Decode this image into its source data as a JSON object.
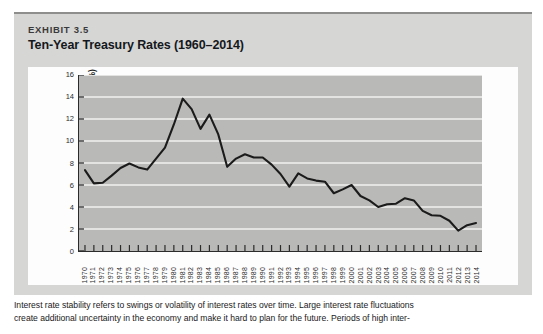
{
  "exhibit": {
    "label": "EXHIBIT 3.5",
    "title": "Ten-Year Treasury Rates (1960–2014)"
  },
  "caption": {
    "line1": "Interest rate stability refers to swings or volatility of interest rates over time. Large interest rate fluctuations",
    "line2": "create additional uncertainty in the economy and make it hard to plan for the future. Periods of high inter-"
  },
  "colors": {
    "exhibit_background": "#d6d6d4",
    "plot_background": "#b9b9b7",
    "gridline": "#f2f2f0",
    "line": "#1b1b1b",
    "axis": "#2b2b2b",
    "card_background": "#fdfdfd",
    "text": "#1a1a1a"
  },
  "chart_data": {
    "type": "line",
    "title": "Ten-Year Treasury Rates (1960–2014)",
    "xlabel": "",
    "ylabel": "10-Year treasury yield (%)",
    "ylim": [
      0,
      16
    ],
    "yticks": [
      0,
      2,
      4,
      6,
      8,
      10,
      12,
      14,
      16
    ],
    "ytick_labels": [
      "0",
      "2",
      "4",
      "6",
      "8",
      "10",
      "12",
      "14",
      "16"
    ],
    "grid": true,
    "grid_axis": "y",
    "legend": false,
    "legend_position": "none",
    "x": [
      1970,
      1971,
      1972,
      1973,
      1974,
      1975,
      1976,
      1977,
      1978,
      1979,
      1980,
      1981,
      1982,
      1983,
      1984,
      1985,
      1986,
      1987,
      1988,
      1989,
      1990,
      1991,
      1992,
      1993,
      1994,
      1995,
      1996,
      1997,
      1998,
      1999,
      2000,
      2001,
      2002,
      2003,
      2004,
      2005,
      2006,
      2007,
      2008,
      2009,
      2010,
      2011,
      2012,
      2013,
      2014
    ],
    "xtick_labels": [
      "1970",
      "1971",
      "1972",
      "1973",
      "1974",
      "1975",
      "1976",
      "1977",
      "1978",
      "1979",
      "1980",
      "1981",
      "1982",
      "1983",
      "1984",
      "1985",
      "1986",
      "1987",
      "1988",
      "1989",
      "1990",
      "1991",
      "1992",
      "1993",
      "1994",
      "1995",
      "1996",
      "1997",
      "1998",
      "1999",
      "2000",
      "2001",
      "2002",
      "2003",
      "2004",
      "2005",
      "2006",
      "2007",
      "2008",
      "2009",
      "2010",
      "2011",
      "2012",
      "2013",
      "2014"
    ],
    "values": [
      7.35,
      6.15,
      6.2,
      6.85,
      7.55,
      7.95,
      7.6,
      7.4,
      8.4,
      9.4,
      11.5,
      13.85,
      12.9,
      11.1,
      12.4,
      10.6,
      7.65,
      8.4,
      8.8,
      8.5,
      8.5,
      7.85,
      7.0,
      5.85,
      7.05,
      6.6,
      6.4,
      6.3,
      5.25,
      5.6,
      6.0,
      5.0,
      4.6,
      4.0,
      4.25,
      4.3,
      4.8,
      4.6,
      3.65,
      3.25,
      3.2,
      2.75,
      1.85,
      2.35,
      2.55
    ],
    "series": [
      {
        "name": "10-Year treasury yield (%)",
        "values": [
          7.35,
          6.15,
          6.2,
          6.85,
          7.55,
          7.95,
          7.6,
          7.4,
          8.4,
          9.4,
          11.5,
          13.85,
          12.9,
          11.1,
          12.4,
          10.6,
          7.65,
          8.4,
          8.8,
          8.5,
          8.5,
          7.85,
          7.0,
          5.85,
          7.05,
          6.6,
          6.4,
          6.3,
          5.25,
          5.6,
          6.0,
          5.0,
          4.6,
          4.0,
          4.25,
          4.3,
          4.8,
          4.6,
          3.65,
          3.25,
          3.2,
          2.75,
          1.85,
          2.35,
          2.55
        ]
      }
    ]
  }
}
